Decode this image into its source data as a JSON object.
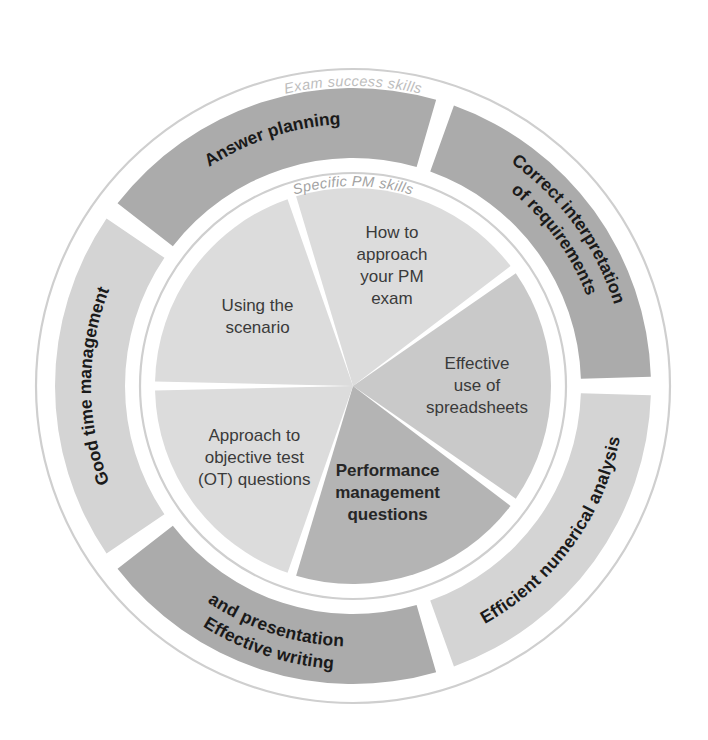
{
  "diagram": {
    "type": "concentric-wheel",
    "title_visible": false,
    "center": {
      "x": 353,
      "y": 386
    },
    "colors": {
      "background": "#ffffff",
      "ring_outline": "#cfcfcf",
      "outer_segment_dark": "#ababab",
      "outer_segment_light": "#d4d4d4",
      "inner_segment_dark": "#b4b4b4",
      "inner_segment_mid": "#c9c9c9",
      "inner_segment_light": "#dcdcdc",
      "divider": "#ffffff",
      "label_dark": "#1a1a1a",
      "label_mid": "#3a3a3a",
      "ring_label": "#b8b8b8",
      "ring_label_inner": "#9a9a9a"
    },
    "outer_ring_label": "Exam success skills",
    "inner_ring_label": "Specific PM skills",
    "outer_segments": [
      {
        "label": "Answer planning",
        "lines": [
          "Answer planning"
        ],
        "tone": "dark",
        "start_angle": -54,
        "end_angle": 18
      },
      {
        "label": "Correct interpretation of requirements",
        "lines": [
          "Correct interpretation",
          "of requirements"
        ],
        "tone": "dark",
        "start_angle": 18,
        "end_angle": 90
      },
      {
        "label": "Efficient numerical analysis",
        "lines": [
          "Efficient numerical analysis"
        ],
        "tone": "light",
        "start_angle": 90,
        "end_angle": 162
      },
      {
        "label": "Effective writing and presentation",
        "lines": [
          "Effective writing",
          "and presentation"
        ],
        "tone": "dark",
        "start_angle": 162,
        "end_angle": 234
      },
      {
        "label": "Good time management",
        "lines": [
          "Good time management"
        ],
        "tone": "light",
        "start_angle": 234,
        "end_angle": 306
      }
    ],
    "inner_segments": [
      {
        "label": "Using the scenario",
        "lines": [
          "Using the",
          "scenario"
        ],
        "tone": "light",
        "weight": "normal",
        "start_angle": -90,
        "end_angle": -18
      },
      {
        "label": "How to approach your PM exam",
        "lines": [
          "How to",
          "approach",
          "your PM",
          "exam"
        ],
        "tone": "light",
        "weight": "normal",
        "start_angle": -18,
        "end_angle": 54
      },
      {
        "label": "Effective use of spreadsheets",
        "lines": [
          "Effective",
          "use of",
          "spreadsheets"
        ],
        "tone": "mid",
        "weight": "normal",
        "start_angle": 54,
        "end_angle": 126
      },
      {
        "label": "Performance management questions",
        "lines": [
          "Performance",
          "management",
          "questions"
        ],
        "tone": "dark",
        "weight": "bold",
        "start_angle": 126,
        "end_angle": 198
      },
      {
        "label": "Approach to objective test (OT) questions",
        "lines": [
          "Approach to",
          "objective test",
          "(OT) questions"
        ],
        "tone": "light",
        "weight": "normal",
        "start_angle": 198,
        "end_angle": 270
      }
    ]
  }
}
